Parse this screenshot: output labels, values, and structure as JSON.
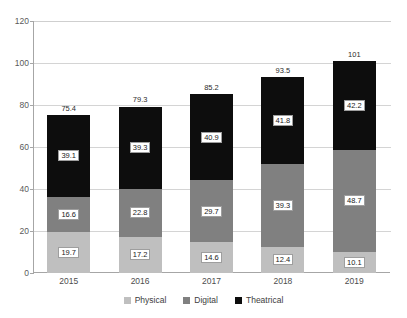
{
  "chart_data": {
    "type": "bar",
    "subtype": "stacked-bar",
    "title": "",
    "subtitle": "",
    "xlabel": "",
    "ylabel": "",
    "categories": [
      "2015",
      "2016",
      "2017",
      "2018",
      "2019"
    ],
    "ylim": [
      0,
      120
    ],
    "y_ticks": [
      0,
      20,
      40,
      60,
      80,
      100,
      120
    ],
    "y_tick_labels": [
      "0",
      "20",
      "40",
      "60",
      "80",
      "100",
      "120"
    ],
    "grid": true,
    "grid_axis": "y",
    "legend_position": "bottom",
    "stack_order_bottom_to_top": [
      "Physical",
      "Digital",
      "Theatrical"
    ],
    "series": [
      {
        "name": "Physical",
        "color": "#bfbfbf",
        "values": [
          19.7,
          17.2,
          14.6,
          12.4,
          10.1
        ]
      },
      {
        "name": "Digital",
        "color": "#808080",
        "values": [
          16.6,
          22.8,
          29.7,
          39.3,
          48.7
        ]
      },
      {
        "name": "Theatrical",
        "color": "#0d0d0d",
        "values": [
          39.1,
          39.3,
          40.9,
          41.8,
          42.2
        ]
      }
    ],
    "totals": [
      75.4,
      79.3,
      85.2,
      93.5,
      101
    ],
    "total_labels": [
      "75.4",
      "79.3",
      "85.2",
      "93.5",
      "101"
    ],
    "data_labels": {
      "Physical": [
        "19.7",
        "17.2",
        "14.6",
        "12.4",
        "10.1"
      ],
      "Digital": [
        "16.6",
        "22.8",
        "29.7",
        "39.3",
        "48.7"
      ],
      "Theatrical": [
        "39.1",
        "39.3",
        "40.9",
        "41.8",
        "42.2"
      ]
    }
  },
  "legend": {
    "items": [
      {
        "label": "Physical",
        "color": "#bfbfbf"
      },
      {
        "label": "Digital",
        "color": "#808080"
      },
      {
        "label": "Theatrical",
        "color": "#0d0d0d"
      }
    ]
  },
  "colors": {
    "physical": "#bfbfbf",
    "digital": "#808080",
    "theatrical": "#0d0d0d",
    "gridline": "#d4d4d4",
    "axis": "#a6a6a6",
    "background": "#ffffff"
  }
}
